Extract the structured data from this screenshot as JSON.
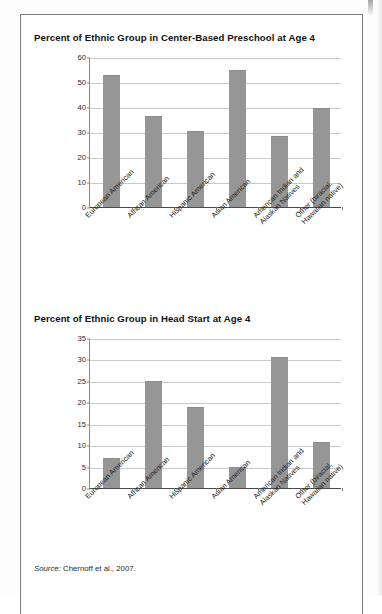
{
  "figure": {
    "source_label": "Source:",
    "source_text": " Chernoff et al., 2007.",
    "bar_color": "#969696",
    "grid_color": "#c9c9c9",
    "axis_color": "#4a4a4a"
  },
  "chart_data": [
    {
      "type": "bar",
      "title": "Percent of Ethnic Group in Center-Based Preschool at Age 4",
      "xlabel": "",
      "ylabel": "",
      "ylim": [
        0,
        60
      ],
      "yticks": [
        0,
        10,
        20,
        30,
        40,
        50,
        60
      ],
      "ytick_labels": [
        "0",
        "10",
        "20",
        "30",
        "40",
        "50",
        "60"
      ],
      "grid": true,
      "legend": "none",
      "categories": [
        "European American",
        "African American",
        "Hispanic American",
        "Asian American",
        "American Indian and\nAlaskan Natives",
        "Other (biracial,\nHawaiian native)"
      ],
      "values": [
        52.8,
        36.6,
        30.5,
        54.8,
        28.6,
        39.5
      ]
    },
    {
      "type": "bar",
      "title": "Percent of Ethnic Group in Head Start at Age 4",
      "xlabel": "",
      "ylabel": "",
      "ylim": [
        0,
        35
      ],
      "yticks": [
        0,
        5,
        10,
        15,
        20,
        25,
        30,
        35
      ],
      "ytick_labels": [
        "0",
        "5",
        "10",
        "15",
        "20",
        "25",
        "30",
        "35"
      ],
      "grid": true,
      "legend": "none",
      "categories": [
        "European American",
        "African American",
        "Hispanic American",
        "Asian American",
        "American Indian and\nAlaskan Natives",
        "Other (biracial,\nHawaiian native)"
      ],
      "values": [
        6.9,
        24.9,
        18.8,
        4.9,
        30.6,
        10.7
      ]
    }
  ]
}
